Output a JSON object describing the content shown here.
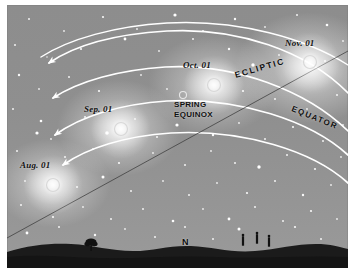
{
  "figure": {
    "background_color": "#8f8f8f",
    "ground_color": "#1a1a1a",
    "line_color": "#ffffff"
  },
  "sun_markers": [
    {
      "label": "Aug. 01",
      "name": "sun-marker-aug",
      "cx": 46,
      "cy": 180,
      "r": 6.5,
      "label_x": 14,
      "label_y": 160
    },
    {
      "label": "Sep. 01",
      "name": "sun-marker-sep",
      "cx": 114,
      "cy": 124,
      "r": 6.5,
      "label_x": 78,
      "label_y": 104
    },
    {
      "label": "Oct. 01",
      "name": "sun-marker-oct",
      "cx": 207,
      "cy": 80,
      "r": 6.5,
      "label_x": 177,
      "label_y": 60
    },
    {
      "label": "Nov. 01",
      "name": "sun-marker-nov",
      "cx": 303,
      "cy": 57,
      "r": 6.5,
      "label_x": 279,
      "label_y": 38
    }
  ],
  "annotations": {
    "ecliptic": "ECLIPTIC",
    "equator": "EQUATOR",
    "spring_equinox_line1": "SPRING",
    "spring_equinox_line2": "EQUINOX",
    "north": "N"
  },
  "equinox_marker": {
    "cx": 176,
    "cy": 90,
    "r": 3.5
  },
  "daily_paths": [
    {
      "name": "daily-path-nov",
      "d": "M 341 88 C 300 46, 230 22, 160 26 C 110 29, 68 40, 42 58"
    },
    {
      "name": "daily-path-oct",
      "d": "M 341 126 C 300 86, 228 58, 158 62 C 112 65, 72 76, 46 93"
    },
    {
      "name": "daily-path-sep",
      "d": "M 341 150 C 304 116, 232 92, 160 96 C 114 99, 74 111, 48 130"
    },
    {
      "name": "daily-path-aug",
      "d": "M 341 178 C 306 146, 236 124, 164 128 C 118 131, 80 143, 56 160"
    }
  ],
  "ecliptic_path": "M 0 233 L 341 46",
  "equator_path": "M 341 60 C 300 34, 232 14, 160 18 C 108 21, 62 34, 34 52",
  "horizon_figures": [
    {
      "name": "tree-silhouette",
      "x": 84,
      "y": 236
    },
    {
      "name": "person-silhouette-1",
      "x": 236,
      "y": 230
    },
    {
      "name": "person-silhouette-2",
      "x": 250,
      "y": 228
    },
    {
      "name": "person-silhouette-3",
      "x": 262,
      "y": 231
    }
  ],
  "stars": [
    {
      "x": 22,
      "y": 14,
      "r": 1.0
    },
    {
      "x": 57,
      "y": 26,
      "r": 0.9
    },
    {
      "x": 96,
      "y": 12,
      "r": 1.1
    },
    {
      "x": 130,
      "y": 24,
      "r": 0.9
    },
    {
      "x": 168,
      "y": 10,
      "r": 1.6
    },
    {
      "x": 196,
      "y": 26,
      "r": 1.0
    },
    {
      "x": 228,
      "y": 14,
      "r": 1.2
    },
    {
      "x": 258,
      "y": 22,
      "r": 0.9
    },
    {
      "x": 290,
      "y": 10,
      "r": 1.0
    },
    {
      "x": 320,
      "y": 20,
      "r": 1.3
    },
    {
      "x": 336,
      "y": 36,
      "r": 0.9
    },
    {
      "x": 8,
      "y": 40,
      "r": 1.0
    },
    {
      "x": 40,
      "y": 52,
      "r": 0.8
    },
    {
      "x": 74,
      "y": 44,
      "r": 1.1
    },
    {
      "x": 118,
      "y": 34,
      "r": 1.4
    },
    {
      "x": 152,
      "y": 46,
      "r": 0.9
    },
    {
      "x": 186,
      "y": 34,
      "r": 1.0
    },
    {
      "x": 222,
      "y": 44,
      "r": 1.2
    },
    {
      "x": 246,
      "y": 60,
      "r": 1.7
    },
    {
      "x": 272,
      "y": 50,
      "r": 0.9
    },
    {
      "x": 318,
      "y": 56,
      "r": 1.0
    },
    {
      "x": 12,
      "y": 70,
      "r": 1.2
    },
    {
      "x": 32,
      "y": 84,
      "r": 0.9
    },
    {
      "x": 62,
      "y": 72,
      "r": 1.0
    },
    {
      "x": 92,
      "y": 86,
      "r": 1.1
    },
    {
      "x": 134,
      "y": 70,
      "r": 0.9
    },
    {
      "x": 160,
      "y": 84,
      "r": 0.9
    },
    {
      "x": 190,
      "y": 96,
      "r": 1.0
    },
    {
      "x": 236,
      "y": 86,
      "r": 1.1
    },
    {
      "x": 268,
      "y": 94,
      "r": 1.0
    },
    {
      "x": 300,
      "y": 104,
      "r": 0.9
    },
    {
      "x": 330,
      "y": 90,
      "r": 1.0
    },
    {
      "x": 6,
      "y": 104,
      "r": 1.0
    },
    {
      "x": 34,
      "y": 116,
      "r": 1.3
    },
    {
      "x": 30,
      "y": 128,
      "r": 1.6
    },
    {
      "x": 44,
      "y": 134,
      "r": 0.9
    },
    {
      "x": 78,
      "y": 112,
      "r": 1.0
    },
    {
      "x": 100,
      "y": 128,
      "r": 1.8
    },
    {
      "x": 128,
      "y": 114,
      "r": 0.9
    },
    {
      "x": 150,
      "y": 132,
      "r": 1.0
    },
    {
      "x": 170,
      "y": 120,
      "r": 1.6
    },
    {
      "x": 206,
      "y": 130,
      "r": 1.2
    },
    {
      "x": 232,
      "y": 118,
      "r": 0.9
    },
    {
      "x": 258,
      "y": 134,
      "r": 1.0
    },
    {
      "x": 286,
      "y": 122,
      "r": 1.1
    },
    {
      "x": 316,
      "y": 136,
      "r": 1.0
    },
    {
      "x": 336,
      "y": 120,
      "r": 0.9
    },
    {
      "x": 10,
      "y": 146,
      "r": 1.0
    },
    {
      "x": 58,
      "y": 152,
      "r": 1.0
    },
    {
      "x": 86,
      "y": 144,
      "r": 0.9
    },
    {
      "x": 112,
      "y": 158,
      "r": 1.1
    },
    {
      "x": 146,
      "y": 148,
      "r": 0.9
    },
    {
      "x": 178,
      "y": 160,
      "r": 1.0
    },
    {
      "x": 204,
      "y": 146,
      "r": 0.9
    },
    {
      "x": 228,
      "y": 158,
      "r": 1.0
    },
    {
      "x": 252,
      "y": 162,
      "r": 1.7
    },
    {
      "x": 280,
      "y": 150,
      "r": 1.0
    },
    {
      "x": 308,
      "y": 164,
      "r": 1.1
    },
    {
      "x": 334,
      "y": 152,
      "r": 0.9
    },
    {
      "x": 18,
      "y": 176,
      "r": 0.9
    },
    {
      "x": 70,
      "y": 182,
      "r": 1.0
    },
    {
      "x": 96,
      "y": 172,
      "r": 1.5
    },
    {
      "x": 124,
      "y": 186,
      "r": 1.0
    },
    {
      "x": 156,
      "y": 176,
      "r": 0.9
    },
    {
      "x": 182,
      "y": 190,
      "r": 1.0
    },
    {
      "x": 210,
      "y": 178,
      "r": 0.9
    },
    {
      "x": 240,
      "y": 188,
      "r": 1.1
    },
    {
      "x": 268,
      "y": 176,
      "r": 1.0
    },
    {
      "x": 296,
      "y": 190,
      "r": 1.2
    },
    {
      "x": 324,
      "y": 180,
      "r": 0.9
    },
    {
      "x": 14,
      "y": 200,
      "r": 1.0
    },
    {
      "x": 46,
      "y": 212,
      "r": 1.1
    },
    {
      "x": 76,
      "y": 202,
      "r": 0.9
    },
    {
      "x": 104,
      "y": 214,
      "r": 1.0
    },
    {
      "x": 136,
      "y": 204,
      "r": 1.0
    },
    {
      "x": 166,
      "y": 216,
      "r": 1.3
    },
    {
      "x": 196,
      "y": 204,
      "r": 0.9
    },
    {
      "x": 222,
      "y": 214,
      "r": 1.4
    },
    {
      "x": 248,
      "y": 202,
      "r": 1.0
    },
    {
      "x": 276,
      "y": 216,
      "r": 1.0
    },
    {
      "x": 304,
      "y": 206,
      "r": 1.1
    },
    {
      "x": 330,
      "y": 214,
      "r": 0.9
    },
    {
      "x": 20,
      "y": 228,
      "r": 1.4
    },
    {
      "x": 52,
      "y": 222,
      "r": 1.0
    },
    {
      "x": 88,
      "y": 230,
      "r": 1.2
    },
    {
      "x": 118,
      "y": 224,
      "r": 0.9
    },
    {
      "x": 148,
      "y": 232,
      "r": 1.0
    },
    {
      "x": 178,
      "y": 222,
      "r": 1.0
    },
    {
      "x": 206,
      "y": 234,
      "r": 1.0
    },
    {
      "x": 232,
      "y": 224,
      "r": 1.5
    },
    {
      "x": 262,
      "y": 232,
      "r": 1.0
    },
    {
      "x": 288,
      "y": 222,
      "r": 1.1
    },
    {
      "x": 314,
      "y": 234,
      "r": 1.0
    }
  ]
}
